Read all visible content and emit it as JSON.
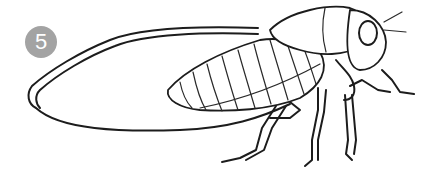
{
  "illustration": {
    "subject": "cicada line drawing",
    "badge": {
      "number": "5",
      "color": "#a3a3a3",
      "text_color": "#ffffff"
    },
    "line_color": "#1c1c1c",
    "background": "#ffffff"
  }
}
